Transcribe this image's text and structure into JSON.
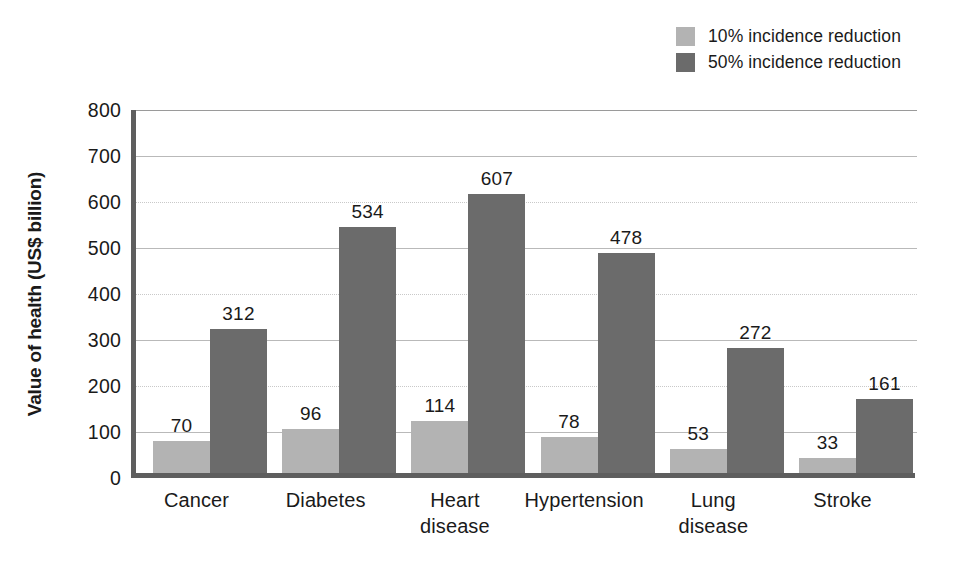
{
  "chart_data": {
    "type": "bar",
    "title": "",
    "xlabel": "",
    "ylabel": "Value of health (US$ billion)",
    "ylim": [
      0,
      800
    ],
    "ytick_step": 100,
    "grid": true,
    "legend_position": "top-right",
    "categories": [
      "Cancer",
      "Diabetes",
      "Heart disease",
      "Hypertension",
      "Lung disease",
      "Stroke"
    ],
    "category_lines": [
      [
        "Cancer"
      ],
      [
        "Diabetes"
      ],
      [
        "Heart",
        "disease"
      ],
      [
        "Hypertension"
      ],
      [
        "Lung",
        "disease"
      ],
      [
        "Stroke"
      ]
    ],
    "ytick_labels": [
      "800",
      "700",
      "600",
      "500",
      "400",
      "300",
      "200",
      "100",
      "0"
    ],
    "ytick_values": [
      800,
      700,
      600,
      500,
      400,
      300,
      200,
      100,
      0
    ],
    "series": [
      {
        "name": "10% incidence reduction",
        "color": "#b3b3b3",
        "values": [
          70,
          96,
          114,
          78,
          53,
          33
        ]
      },
      {
        "name": "50% incidence reduction",
        "color": "#6b6b6b",
        "values": [
          312,
          534,
          607,
          478,
          272,
          161
        ]
      }
    ]
  },
  "legend": {
    "items": [
      {
        "label": "10% incidence reduction",
        "color": "#b3b3b3"
      },
      {
        "label": "50% incidence reduction",
        "color": "#6b6b6b"
      }
    ]
  }
}
